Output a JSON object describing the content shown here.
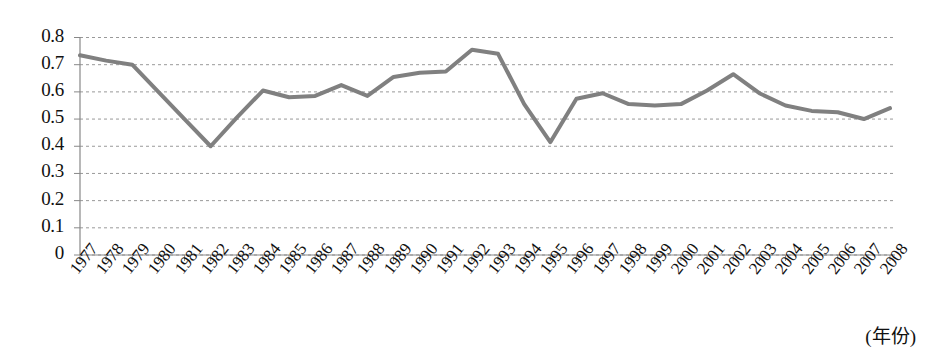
{
  "chart_data": {
    "type": "line",
    "title": "",
    "subtitle": "",
    "xlabel": "(年份)",
    "ylabel": "",
    "grid": true,
    "legend": false,
    "legend_position": "none",
    "line_color": "#808080",
    "axis_color": "#666666",
    "grid_color": "#999999",
    "xlim": [
      1977,
      2008
    ],
    "ylim": [
      0,
      0.8
    ],
    "ytick_labels": [
      "0.8",
      "0.7",
      "0.6",
      "0.5",
      "0.4",
      "0.3",
      "0.2",
      "0.1",
      "0"
    ],
    "ytick_values": [
      0.8,
      0.7,
      0.6,
      0.5,
      0.4,
      0.3,
      0.2,
      0.1,
      0
    ],
    "categories": [
      "1977",
      "1978",
      "1979",
      "1980",
      "1981",
      "1982",
      "1983",
      "1984",
      "1985",
      "1986",
      "1987",
      "1988",
      "1989",
      "1990",
      "1991",
      "1992",
      "1993",
      "1994",
      "1995",
      "1996",
      "1997",
      "1998",
      "1999",
      "2000",
      "2001",
      "2002",
      "2003",
      "2004",
      "2005",
      "2006",
      "2007",
      "2008"
    ],
    "values": [
      0.735,
      0.715,
      0.7,
      0.6,
      0.5,
      0.4,
      0.505,
      0.605,
      0.58,
      0.585,
      0.625,
      0.585,
      0.655,
      0.67,
      0.675,
      0.755,
      0.74,
      0.555,
      0.415,
      0.575,
      0.595,
      0.555,
      0.55,
      0.555,
      0.605,
      0.665,
      0.595,
      0.55,
      0.53,
      0.525,
      0.5,
      0.54
    ]
  },
  "axis": {
    "x_title": "(年份)"
  }
}
